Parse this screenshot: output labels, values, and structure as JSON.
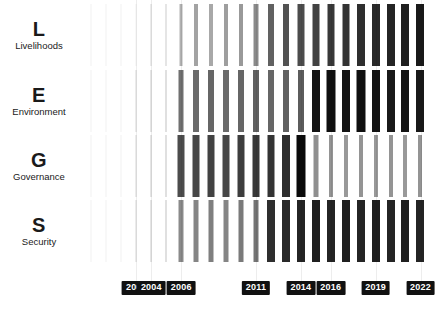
{
  "chart_data": {
    "type": "bar",
    "title": "",
    "xlabel": "",
    "ylabel": "",
    "grid": true,
    "legend_position": "none",
    "x_start": 2000,
    "x_end": 2022,
    "tick_labels": [
      "2003",
      "2004",
      "2006",
      "2011",
      "2014",
      "2016",
      "2019",
      "2022"
    ],
    "tick_values": [
      2003,
      2004,
      2006,
      2011,
      2014,
      2016,
      2019,
      2022
    ],
    "categories": [
      2000,
      2001,
      2002,
      2003,
      2004,
      2005,
      2006,
      2007,
      2008,
      2009,
      2010,
      2011,
      2012,
      2013,
      2014,
      2015,
      2016,
      2017,
      2018,
      2019,
      2020,
      2021,
      2022
    ],
    "series": [
      {
        "name": "Livelihoods",
        "letter": "L",
        "values": [
          3,
          4,
          5,
          6,
          8,
          10,
          30,
          36,
          34,
          38,
          40,
          46,
          62,
          68,
          70,
          74,
          78,
          80,
          82,
          84,
          86,
          88,
          90
        ]
      },
      {
        "name": "Environment",
        "letter": "E",
        "values": [
          4,
          5,
          6,
          8,
          10,
          12,
          56,
          58,
          60,
          58,
          60,
          62,
          60,
          62,
          64,
          92,
          94,
          92,
          94,
          92,
          90,
          92,
          90
        ]
      },
      {
        "name": "Governance",
        "letter": "G",
        "values": [
          4,
          5,
          6,
          8,
          10,
          12,
          70,
          72,
          74,
          72,
          76,
          78,
          80,
          82,
          96,
          44,
          42,
          40,
          42,
          40,
          42,
          40,
          42
        ]
      },
      {
        "name": "Security",
        "letter": "S",
        "values": [
          4,
          5,
          6,
          8,
          10,
          12,
          46,
          48,
          50,
          48,
          52,
          54,
          82,
          84,
          86,
          88,
          86,
          88,
          86,
          88,
          86,
          88,
          86
        ]
      }
    ]
  },
  "colors": {
    "bar": "#000000",
    "background": "#ffffff",
    "gridline": "#ededed",
    "tag_background": "#111111",
    "tag_text": "#ffffff",
    "label_text": "#1a1a1a"
  }
}
